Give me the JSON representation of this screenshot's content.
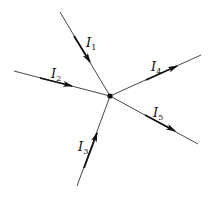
{
  "diagram": {
    "type": "circuit-node-currents",
    "node": {
      "x": 110,
      "y": 96
    },
    "currents": [
      {
        "id": "I1",
        "label": "I",
        "sub": "1",
        "direction": "in",
        "from": [
          60,
          12
        ],
        "to": [
          110,
          96
        ]
      },
      {
        "id": "I2",
        "label": "I",
        "sub": "2",
        "direction": "in",
        "from": [
          14,
          71
        ],
        "to": [
          110,
          96
        ]
      },
      {
        "id": "I3",
        "label": "I",
        "sub": "3",
        "direction": "in",
        "from": [
          77,
          186
        ],
        "to": [
          110,
          96
        ]
      },
      {
        "id": "I4",
        "label": "I",
        "sub": "4",
        "direction": "out",
        "from": [
          110,
          96
        ],
        "to": [
          201,
          55
        ]
      },
      {
        "id": "I5",
        "label": "I",
        "sub": "5",
        "direction": "out",
        "from": [
          110,
          96
        ],
        "to": [
          198,
          144
        ]
      }
    ],
    "colors": {
      "line": "#333333",
      "arrow": "#111111",
      "node": "#111111"
    }
  }
}
